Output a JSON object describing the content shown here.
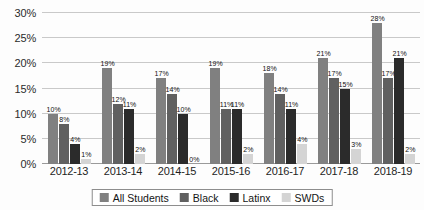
{
  "chart_data": {
    "type": "bar",
    "title": "",
    "xlabel": "",
    "ylabel": "",
    "ylim": [
      0,
      31
    ],
    "grid": true,
    "legend_position": "bottom",
    "categories": [
      "2012-13",
      "2013-14",
      "2014-15",
      "2015-16",
      "2016-17",
      "2017-18",
      "2018-19"
    ],
    "ytick_labels": [
      "0%",
      "5%",
      "10%",
      "15%",
      "20%",
      "25%",
      "30%"
    ],
    "ytick_values": [
      0,
      5,
      10,
      15,
      20,
      25,
      30
    ],
    "series": [
      {
        "name": "All Students",
        "color": "#808080",
        "values": [
          10,
          19,
          17,
          19,
          18,
          21,
          28
        ],
        "labels": [
          "10%",
          "19%",
          "17%",
          "19%",
          "18%",
          "21%",
          "28%"
        ]
      },
      {
        "name": "Black",
        "color": "#606060",
        "values": [
          8,
          12,
          14,
          11,
          14,
          17,
          17
        ],
        "labels": [
          "8%",
          "12%",
          "14%",
          "11%",
          "14%",
          "17%",
          "17%"
        ]
      },
      {
        "name": "Latinx",
        "color": "#2b2b2b",
        "values": [
          4,
          11,
          10,
          11,
          11,
          15,
          21
        ],
        "labels": [
          "4%",
          "11%",
          "10%",
          "11%",
          "11%",
          "15%",
          "21%"
        ]
      },
      {
        "name": "SWDs",
        "color": "#d4d4d4",
        "values": [
          1,
          2,
          0,
          2,
          4,
          3,
          2
        ],
        "labels": [
          "1%",
          "2%",
          "0%",
          "2%",
          "4%",
          "3%",
          "2%"
        ]
      }
    ]
  }
}
